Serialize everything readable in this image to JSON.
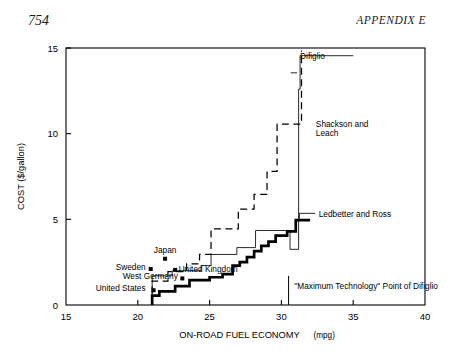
{
  "page": {
    "folio": "754",
    "running_head": "APPENDIX E"
  },
  "chart_data": {
    "type": "line",
    "subtype": "step",
    "title": "",
    "xlabel_main": "ON-ROAD FUEL ECONOMY",
    "xlabel_units": "(mpg)",
    "ylabel": "COST ($/gallon)",
    "xlim": [
      15,
      40
    ],
    "ylim": [
      0,
      15
    ],
    "xticks": [
      15,
      20,
      25,
      30,
      35,
      40
    ],
    "xticklabels": [
      "15",
      "20",
      "25",
      "30",
      "35",
      "40"
    ],
    "yticks": [
      0,
      5,
      10,
      15
    ],
    "yticklabels": [
      "0",
      "5",
      "10",
      "15"
    ],
    "grid": false,
    "legend": "inline-annotations",
    "series": [
      {
        "name": "Ledbetter and Ross",
        "style": "thick-solid",
        "label_x": 32.6,
        "label_y": 5.05,
        "points": [
          [
            21.0,
            0.0
          ],
          [
            21.0,
            0.55
          ],
          [
            21.5,
            0.55
          ],
          [
            21.5,
            0.8
          ],
          [
            22.6,
            0.8
          ],
          [
            22.6,
            1.1
          ],
          [
            23.6,
            1.1
          ],
          [
            23.6,
            1.45
          ],
          [
            25.0,
            1.45
          ],
          [
            25.0,
            1.62
          ],
          [
            25.9,
            1.62
          ],
          [
            25.9,
            1.8
          ],
          [
            26.6,
            1.8
          ],
          [
            26.6,
            2.3
          ],
          [
            27.1,
            2.3
          ],
          [
            27.1,
            2.5
          ],
          [
            27.6,
            2.5
          ],
          [
            27.6,
            2.8
          ],
          [
            28.1,
            2.8
          ],
          [
            28.1,
            3.15
          ],
          [
            28.6,
            3.15
          ],
          [
            28.6,
            3.45
          ],
          [
            29.1,
            3.45
          ],
          [
            29.1,
            3.7
          ],
          [
            29.6,
            3.7
          ],
          [
            29.6,
            4.05
          ],
          [
            30.4,
            4.05
          ],
          [
            30.4,
            4.3
          ],
          [
            31.0,
            4.3
          ],
          [
            31.0,
            4.95
          ],
          [
            32.0,
            4.95
          ]
        ]
      },
      {
        "name": "Difiglio",
        "style": "thin-solid",
        "label_x": 31.3,
        "label_y": 14.55,
        "points": [
          [
            21.0,
            0.0
          ],
          [
            21.0,
            1.7
          ],
          [
            22.4,
            1.7
          ],
          [
            22.4,
            2.0
          ],
          [
            24.4,
            2.0
          ],
          [
            24.4,
            2.3
          ],
          [
            25.1,
            2.3
          ],
          [
            25.1,
            2.95
          ],
          [
            26.9,
            2.95
          ],
          [
            26.9,
            3.35
          ],
          [
            28.2,
            3.35
          ],
          [
            28.2,
            4.35
          ],
          [
            30.6,
            4.35
          ],
          [
            30.6,
            3.25
          ],
          [
            31.2,
            3.25
          ],
          [
            31.2,
            12.6
          ],
          [
            31.3,
            12.6
          ],
          [
            31.3,
            14.55
          ],
          [
            35.0,
            14.55
          ]
        ]
      },
      {
        "name": "Shackson and Leach",
        "style": "dashed",
        "label_x": 32.4,
        "label_y": 10.55,
        "points": [
          [
            21.0,
            0.0
          ],
          [
            21.0,
            1.4
          ],
          [
            22.1,
            1.4
          ],
          [
            22.1,
            1.95
          ],
          [
            23.4,
            1.95
          ],
          [
            23.4,
            2.4
          ],
          [
            24.3,
            2.4
          ],
          [
            24.3,
            2.95
          ],
          [
            25.1,
            2.95
          ],
          [
            25.1,
            4.45
          ],
          [
            27.0,
            4.45
          ],
          [
            27.0,
            5.6
          ],
          [
            28.1,
            5.6
          ],
          [
            28.1,
            6.45
          ],
          [
            29.0,
            6.45
          ],
          [
            29.0,
            7.8
          ],
          [
            29.7,
            7.8
          ],
          [
            29.7,
            10.55
          ],
          [
            31.4,
            10.55
          ],
          [
            31.4,
            14.85
          ]
        ]
      }
    ],
    "country_points": [
      {
        "label": "Japan",
        "x": 21.9,
        "y": 2.7,
        "label_anchor": "middle",
        "label_dx": 0,
        "label_dy": -5.5
      },
      {
        "label": "Sweden",
        "x": 20.9,
        "y": 2.1,
        "label_anchor": "end",
        "label_dx": -5,
        "label_dy": 1.0
      },
      {
        "label": "United Kingdom",
        "x": 22.6,
        "y": 2.05,
        "label_anchor": "start",
        "label_dx": 3.5,
        "label_dy": 1.8
      },
      {
        "label": "West Germany",
        "x": 23.1,
        "y": 1.55,
        "label_anchor": "end",
        "label_dx": -4.5,
        "label_dy": 1.0
      },
      {
        "label": "United States",
        "x": 21.1,
        "y": 0.86,
        "label_anchor": "end",
        "label_dx": -8,
        "label_dy": 1.0
      }
    ],
    "annotations": [
      {
        "name": "maximum-technology-note",
        "text": "\"Maximum Technology\" Point of Difiglio",
        "marker_x": 30.5,
        "marker_y_bottom": 0.0,
        "marker_y_top": 1.7,
        "text_x": 30.9,
        "text_y": 0.95
      }
    ]
  }
}
